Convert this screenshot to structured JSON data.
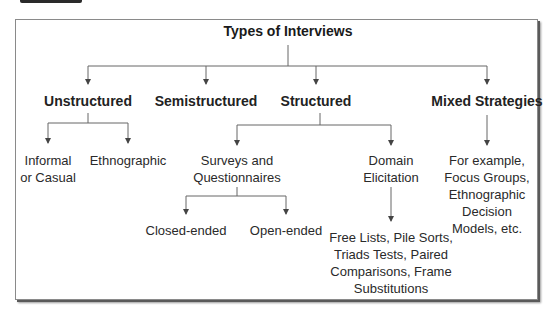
{
  "diagram": {
    "title": "Types of Interviews",
    "categories": [
      {
        "id": "unstructured",
        "label": "Unstructured"
      },
      {
        "id": "semistructured",
        "label": "Semistructured"
      },
      {
        "id": "structured",
        "label": "Structured"
      },
      {
        "id": "mixed",
        "label": "Mixed Strategies"
      }
    ],
    "unstructured_children": [
      {
        "line1": "Informal",
        "line2": "or Casual"
      },
      {
        "line1": "Ethnographic"
      }
    ],
    "structured_children": [
      {
        "line1": "Surveys and",
        "line2": "Questionnaires"
      },
      {
        "line1": "Domain",
        "line2": "Elicitation"
      }
    ],
    "surveys_children": [
      {
        "label": "Closed-ended"
      },
      {
        "label": "Open-ended"
      }
    ],
    "domain_child": {
      "line1": "Free Lists, Pile Sorts,",
      "line2": "Triads Tests, Paired",
      "line3": "Comparisons, Frame",
      "line4": "Substitutions"
    },
    "mixed_child": {
      "line1": "For example,",
      "line2": "Focus Groups,",
      "line3": "Ethnographic",
      "line4": "Decision",
      "line5": "Models, etc."
    },
    "colors": {
      "line": "#555555",
      "text": "#222222",
      "border": "#8a8a8a"
    }
  }
}
